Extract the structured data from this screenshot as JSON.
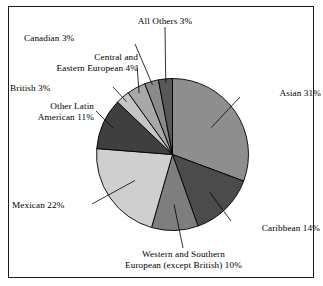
{
  "figure": {
    "background_color": "#ffffff",
    "border_color": "#1a1a1a"
  },
  "chart_data": {
    "type": "pie",
    "title": "",
    "subtitle": "",
    "xlabel": "",
    "ylabel": "",
    "legend_position": "none",
    "grid": false,
    "labels_placement": "external-with-leader-lines",
    "start_angle_deg": 0,
    "direction": "clockwise",
    "units": "percent",
    "total": 100,
    "categories": [
      "Asian",
      "Caribbean",
      "Western and Southern European (except British)",
      "Mexican",
      "Other Latin American",
      "British",
      "Central and Eastern European",
      "Canadian",
      "All Others"
    ],
    "values": [
      31,
      14,
      10,
      22,
      11,
      3,
      4,
      3,
      3
    ],
    "slice_colors": [
      "#8e8e8e",
      "#4b4b4b",
      "#7e7e7e",
      "#cfcfcf",
      "#3f3f3f",
      "#c6c6c6",
      "#a8a8a8",
      "#8a8a8a",
      "#585858"
    ],
    "slices": [
      {
        "label": "Asian 31%",
        "name": "Asian",
        "value": 31,
        "color": "#8e8e8e"
      },
      {
        "label": "Caribbean 14%",
        "name": "Caribbean",
        "value": 14,
        "color": "#4b4b4b"
      },
      {
        "label": "Western and Southern European (except British) 10%",
        "name": "Western and Southern European (except British)",
        "value": 10,
        "color": "#7e7e7e"
      },
      {
        "label": "Mexican 22%",
        "name": "Mexican",
        "value": 22,
        "color": "#cfcfcf"
      },
      {
        "label": "Other Latin American 11%",
        "name": "Other Latin American",
        "value": 11,
        "color": "#3f3f3f"
      },
      {
        "label": "British 3%",
        "name": "British",
        "value": 3,
        "color": "#c6c6c6"
      },
      {
        "label": "Central and Eastern European 4%",
        "name": "Central and Eastern European",
        "value": 4,
        "color": "#a8a8a8"
      },
      {
        "label": "Canadian 3%",
        "name": "Canadian",
        "value": 3,
        "color": "#8a8a8a"
      },
      {
        "label": "All Others 3%",
        "name": "All Others",
        "value": 3,
        "color": "#585858"
      }
    ]
  },
  "labels": {
    "all_others": {
      "line1": "All Others 3%"
    },
    "canadian": {
      "line1": "Canadian 3%"
    },
    "central_eastern_european": {
      "line1": "Central and",
      "line2": "Eastern European 4%"
    },
    "british": {
      "line1": "British 3%"
    },
    "other_latin_american": {
      "line1": "Other Latin",
      "line2": "American 11%"
    },
    "mexican": {
      "line1": "Mexican 22%"
    },
    "western_southern_european": {
      "line1": "Western and Southern",
      "line2": "European (except British) 10%"
    },
    "caribbean": {
      "line1": "Caribbean 14%"
    },
    "asian": {
      "line1": "Asian 31%"
    }
  }
}
